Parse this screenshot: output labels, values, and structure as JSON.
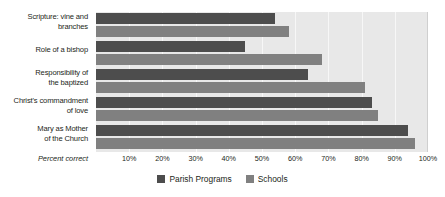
{
  "chart_data": {
    "type": "bar",
    "orientation": "horizontal",
    "title": "",
    "xlabel": "Percent correct",
    "ylabel": "",
    "xlim": [
      0,
      100
    ],
    "grid": true,
    "legend_position": "bottom-center",
    "categories": [
      "Scripture: vine and branches",
      "Role of a bishop",
      "Responsibility of the baptized",
      "Christ's commandment of love",
      "Mary as Mother of the Church"
    ],
    "tick_labels": [
      "10%",
      "20%",
      "30%",
      "40%",
      "50%",
      "60%",
      "70%",
      "80%",
      "90%",
      "100%"
    ],
    "tick_values": [
      10,
      20,
      30,
      40,
      50,
      60,
      70,
      80,
      90,
      100
    ],
    "series": [
      {
        "name": "Parish Programs",
        "color": "#4d4d4d",
        "values": [
          54,
          45,
          64,
          83,
          94
        ]
      },
      {
        "name": "Schools",
        "color": "#808080",
        "values": [
          58,
          68,
          81,
          85,
          96
        ]
      }
    ]
  },
  "categories_display": [
    {
      "line1": "Scripture: vine and",
      "line2": "branches"
    },
    {
      "line1": "Role of a bishop",
      "line2": ""
    },
    {
      "line1": "Responsibility of",
      "line2": "the baptized"
    },
    {
      "line1": "Christ's commandment",
      "line2": "of love"
    },
    {
      "line1": "Mary as Mother",
      "line2": "of the Church"
    }
  ],
  "axis": {
    "caption": "Percent correct",
    "ticks": [
      "10%",
      "20%",
      "30%",
      "40%",
      "50%",
      "60%",
      "70%",
      "80%",
      "90%",
      "100%"
    ]
  },
  "legend": {
    "items": [
      {
        "label": "Parish Programs",
        "color": "#4d4d4d"
      },
      {
        "label": "Schools",
        "color": "#808080"
      }
    ]
  },
  "colors": {
    "plot_background": "#e8e8e8",
    "gridline": "#f7f7f7",
    "parish": "#4d4d4d",
    "schools": "#808080",
    "text": "#231f20"
  }
}
